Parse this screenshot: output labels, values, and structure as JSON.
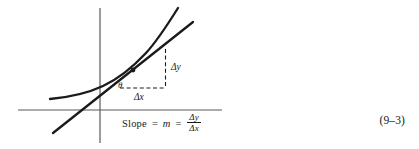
{
  "figure": {
    "name": "slope-tangent-diagram",
    "background_color": "#ffffff",
    "stroke_color": "#1a1a1a",
    "axis_color": "#5a5a5a",
    "labels": {
      "delta_y": "Δy",
      "delta_x": "Δx",
      "theta": "θ"
    },
    "elements": {
      "curve_name": "function-curve",
      "tangent_name": "tangent-line",
      "vertical_axis_name": "y-axis",
      "horizontal_axis_name": "x-axis",
      "point_name": "tangency-point",
      "dashed_rise_name": "delta-y-dashed-line",
      "dashed_run_name": "delta-x-dashed-line"
    }
  },
  "equation": {
    "slope_word": "Slope",
    "equals_1": "=",
    "m_symbol": "m",
    "equals_2": "=",
    "numerator": "Δy",
    "denominator": "Δx",
    "full_text": "Slope = m = Δy/Δx",
    "number": "(9–3)"
  }
}
